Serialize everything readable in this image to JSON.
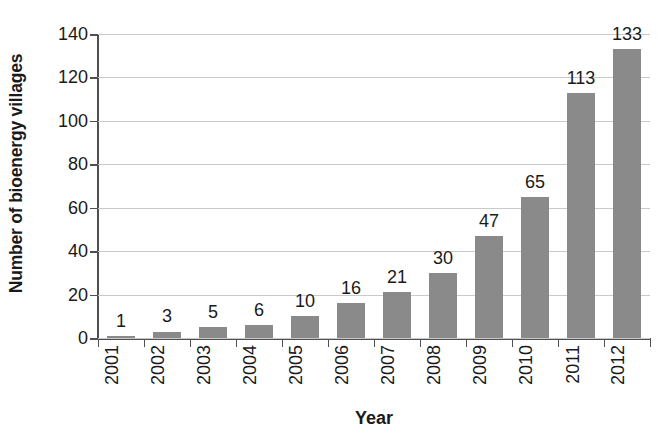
{
  "chart_data": {
    "type": "bar",
    "title": "",
    "subtitle": "",
    "xlabel": "Year",
    "ylabel": "Number of bioenergy villages",
    "categories": [
      "2001",
      "2002",
      "2003",
      "2004",
      "2005",
      "2006",
      "2007",
      "2008",
      "2009",
      "2010",
      "2011",
      "2012"
    ],
    "values": [
      1,
      3,
      5,
      6,
      10,
      16,
      21,
      30,
      47,
      65,
      113,
      133
    ],
    "value_labels": [
      "1",
      "3",
      "5",
      "6",
      "10",
      "16",
      "21",
      "30",
      "47",
      "65",
      "113",
      "133"
    ],
    "ylim": [
      0,
      140
    ],
    "ytick_step": 20,
    "ytick_labels": [
      "0",
      "20",
      "40",
      "60",
      "80",
      "100",
      "120",
      "140"
    ],
    "ytick_values": [
      0,
      20,
      40,
      60,
      80,
      100,
      120,
      140
    ],
    "grid": "horizontal",
    "legend": "none",
    "bar_color": "#8a8a8a",
    "gridline_color": "#c9c9c9",
    "axis_color": "#4f4f4f",
    "text_color": "#1a1a1a",
    "background_color": "#ffffff",
    "data_labels_shown": true,
    "xtick_label_rotation": 90
  }
}
